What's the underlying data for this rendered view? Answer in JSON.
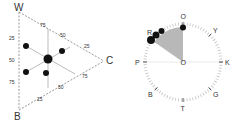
{
  "ternary": {
    "vertices": {
      "top": "W",
      "bottom": "B",
      "right": "C"
    },
    "left_ticks": [
      "25",
      "50",
      "75"
    ],
    "top_right_ticks": [
      "75",
      "50",
      "25"
    ],
    "bottom_right_ticks": [
      "25",
      "50",
      "75"
    ],
    "points": [
      {
        "x": 48,
        "y": 59,
        "r": 4.5,
        "role": "center"
      },
      {
        "x": 26,
        "y": 46,
        "r": 3
      },
      {
        "x": 62,
        "y": 51,
        "r": 3
      },
      {
        "x": 26,
        "y": 72,
        "r": 3
      },
      {
        "x": 46,
        "y": 73,
        "r": 3
      }
    ]
  },
  "dial": {
    "labels": [
      "O",
      "Y",
      "K",
      "G",
      "T",
      "B",
      "P",
      "R"
    ],
    "center_label": "O",
    "sector_color": "#b8b8b8",
    "points": [
      {
        "angle_deg": 0,
        "r": 3
      },
      {
        "angle_deg": -40,
        "r": 3
      },
      {
        "angle_deg": -46,
        "r": 3.5
      },
      {
        "angle_deg": -52,
        "r": 4
      }
    ],
    "sector": {
      "start_deg": -55,
      "end_deg": 0
    }
  }
}
